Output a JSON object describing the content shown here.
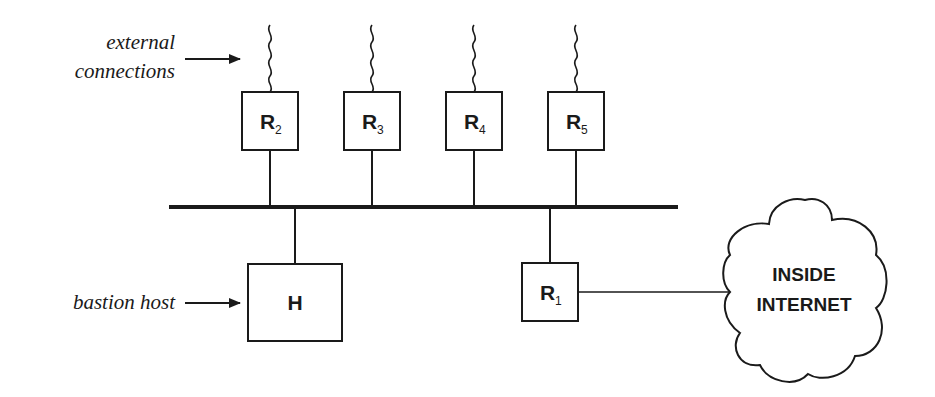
{
  "diagram": {
    "labels": {
      "external_line1": "external",
      "external_line2": "connections",
      "bastion": "bastion host"
    },
    "routers_external": [
      {
        "letter": "R",
        "sub": "2"
      },
      {
        "letter": "R",
        "sub": "3"
      },
      {
        "letter": "R",
        "sub": "4"
      },
      {
        "letter": "R",
        "sub": "5"
      }
    ],
    "router_inside": {
      "letter": "R",
      "sub": "1"
    },
    "bastion_host": {
      "letter": "H"
    },
    "cloud": {
      "line1": "INSIDE",
      "line2": "INTERNET"
    },
    "colors": {
      "ink": "#1a1a1a",
      "background": "#ffffff"
    }
  }
}
